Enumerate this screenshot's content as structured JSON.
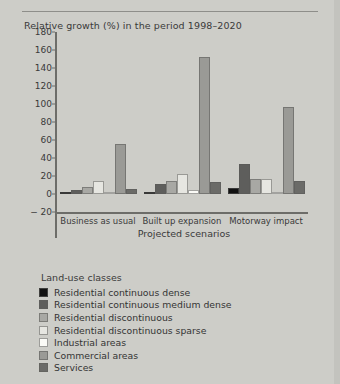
{
  "chart_data": {
    "type": "bar",
    "title": "Relative growth (%) in the period 1998–2020",
    "xlabel": "Projected scenarios",
    "ylabel": "",
    "ylim": [
      -20,
      180
    ],
    "yticks": [
      180,
      160,
      140,
      120,
      100,
      80,
      60,
      40,
      20,
      0,
      -20
    ],
    "ytick_labels": [
      "180",
      "160",
      "140",
      "120",
      "100",
      "80",
      "60",
      "40",
      "20",
      "0",
      "− 20"
    ],
    "grid": false,
    "legend_position": "below",
    "legend_title": "Land-use classes",
    "categories": [
      "Business as usual",
      "Built up expansion",
      "Motorway impact"
    ],
    "series": [
      {
        "name": "Residential continuous dense",
        "color": "#121212",
        "values": [
          0.5,
          0.5,
          7
        ]
      },
      {
        "name": "Residential continuous medium dense",
        "color": "#5e5e5c",
        "values": [
          4,
          11,
          33
        ]
      },
      {
        "name": "Residential discontinuous",
        "color": "#a8a8a4",
        "values": [
          8,
          14,
          17
        ]
      },
      {
        "name": "Residential discontinuous sparse",
        "color": "#e6e6e1",
        "values": [
          15,
          22,
          17
        ]
      },
      {
        "name": "Industrial areas",
        "color": "#fbfbf7",
        "values": [
          1.5,
          5,
          1
        ]
      },
      {
        "name": "Commercial areas",
        "color": "#9a9a96",
        "values": [
          56,
          152,
          97
        ]
      },
      {
        "name": "Services",
        "color": "#6b6b68",
        "values": [
          6,
          13,
          14
        ]
      }
    ]
  },
  "legend": {
    "title": "Land-use classes",
    "items": [
      {
        "label": "Residential continuous dense",
        "color": "#121212"
      },
      {
        "label": "Residential continuous medium dense",
        "color": "#5e5e5c"
      },
      {
        "label": "Residential discontinuous",
        "color": "#a8a8a4"
      },
      {
        "label": "Residential discontinuous sparse",
        "color": "#e6e6e1"
      },
      {
        "label": "Industrial areas",
        "color": "#fbfbf7"
      },
      {
        "label": "Commercial areas",
        "color": "#9a9a96"
      },
      {
        "label": "Services",
        "color": "#6b6b68"
      }
    ]
  }
}
